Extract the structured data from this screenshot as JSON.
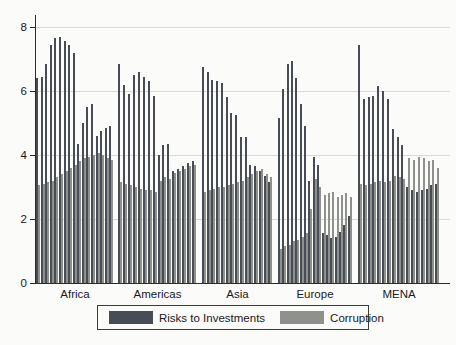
{
  "chart_data": {
    "type": "bar",
    "title": "",
    "xlabel": "",
    "ylabel": "",
    "ylim": [
      0,
      8.4
    ],
    "yticks": [
      0,
      2,
      4,
      6,
      8
    ],
    "grid": "horizontal",
    "legend_position": "bottom-center",
    "legend": [
      {
        "label": "Risks to Investments",
        "color": "#474c55"
      },
      {
        "label": "Corruption",
        "color": "#8f928c"
      }
    ],
    "note": "Paired country-level bars grouped by region; dark = Risks to Investments, light = Corruption",
    "groups": [
      {
        "label": "Africa",
        "risks": [
          6.4,
          6.45,
          6.85,
          7.45,
          7.65,
          7.7,
          7.55,
          7.45,
          7.2,
          4.35,
          5.0,
          5.5,
          5.6,
          4.6,
          4.75,
          4.85,
          4.9
        ],
        "corruption": [
          3.05,
          3.1,
          3.15,
          3.2,
          3.3,
          3.4,
          3.5,
          3.6,
          3.7,
          3.8,
          3.9,
          3.95,
          4.0,
          4.05,
          4.0,
          3.9,
          3.85
        ]
      },
      {
        "label": "Americas",
        "risks": [
          6.85,
          6.2,
          5.9,
          6.5,
          6.6,
          6.45,
          6.3,
          5.85,
          4.0,
          4.3,
          4.35,
          3.5,
          3.55,
          3.65,
          3.75,
          3.8
        ],
        "corruption": [
          3.15,
          3.1,
          3.05,
          3.0,
          2.95,
          2.9,
          2.9,
          2.85,
          3.2,
          3.3,
          3.25,
          3.45,
          3.5,
          3.55,
          3.65,
          3.7
        ]
      },
      {
        "label": "Asia",
        "risks": [
          6.75,
          6.6,
          6.35,
          6.3,
          6.25,
          5.8,
          5.3,
          5.25,
          4.55,
          4.55,
          3.7,
          3.65,
          3.5,
          3.35,
          3.15
        ],
        "corruption": [
          2.85,
          2.9,
          2.95,
          3.0,
          3.0,
          3.05,
          3.1,
          3.15,
          3.2,
          3.3,
          3.4,
          3.5,
          3.55,
          3.4,
          3.3
        ]
      },
      {
        "label": "Europe",
        "risks": [
          5.15,
          6.05,
          6.85,
          6.95,
          6.4,
          5.6,
          4.9,
          3.2,
          3.95,
          3.7,
          1.55,
          1.5,
          1.4,
          1.45,
          1.6,
          1.8,
          2.1
        ],
        "corruption": [
          1.05,
          1.15,
          1.2,
          1.3,
          1.35,
          1.45,
          1.55,
          2.3,
          3.25,
          3.0,
          2.75,
          2.8,
          2.85,
          2.7,
          2.75,
          2.8,
          2.7
        ]
      },
      {
        "label": "MENA",
        "risks": [
          7.45,
          5.75,
          5.8,
          5.85,
          6.15,
          6.0,
          5.75,
          4.8,
          4.55,
          4.3,
          3.0,
          2.9,
          2.85,
          2.9,
          2.95,
          3.05,
          3.1
        ],
        "corruption": [
          3.1,
          3.05,
          3.1,
          3.15,
          3.2,
          3.15,
          3.2,
          3.35,
          3.3,
          3.25,
          3.9,
          3.85,
          3.95,
          3.9,
          3.8,
          3.85,
          3.6
        ]
      }
    ]
  }
}
